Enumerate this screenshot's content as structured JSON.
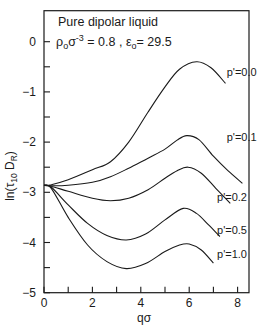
{
  "chart_data": {
    "type": "line",
    "title": "Pure dipolar liquid",
    "subtitle": "ρ₀σ³ = 0.8, ε₀ = 29.5",
    "xlabel": "qσ",
    "ylabel": "ln(τ₁₀D_R)",
    "xlim": [
      0,
      8.5
    ],
    "ylim": [
      -5,
      0.6
    ],
    "xticks": [
      0,
      2,
      4,
      6,
      8
    ],
    "xminor_ticks": [
      1,
      3,
      5,
      7
    ],
    "yticks": [
      0,
      -1,
      -2,
      -3,
      -4,
      -5
    ],
    "yminor_ticks": [
      -0.5,
      -1.5,
      -2.5,
      -3.5,
      -4.5
    ],
    "grid": false,
    "legend_position": "inline labels at curve ends (right)",
    "series": [
      {
        "name": "p'=0.0",
        "x": [
          0,
          0.3,
          1.0,
          2.0,
          2.75,
          3.5,
          4.3,
          5.0,
          5.6,
          6.3,
          6.9,
          7.5
        ],
        "y": [
          -2.86,
          -2.85,
          -2.75,
          -2.55,
          -2.39,
          -2.0,
          -1.4,
          -0.9,
          -0.55,
          -0.4,
          -0.52,
          -0.83
        ]
      },
      {
        "name": "p'=0.1",
        "x": [
          0,
          0.3,
          1.0,
          2.0,
          2.75,
          3.5,
          4.3,
          5.0,
          5.5,
          5.9,
          6.4,
          7.0,
          7.6,
          8.2
        ],
        "y": [
          -2.86,
          -2.87,
          -2.86,
          -2.8,
          -2.69,
          -2.52,
          -2.32,
          -2.14,
          -1.96,
          -1.87,
          -1.95,
          -2.28,
          -2.57,
          -2.82
        ]
      },
      {
        "name": "p'=0.2",
        "x": [
          0,
          0.3,
          1.0,
          2.0,
          2.75,
          3.5,
          4.3,
          5.0,
          5.5,
          5.95,
          6.5,
          7.1,
          7.7
        ],
        "y": [
          -2.86,
          -2.88,
          -2.98,
          -3.12,
          -3.17,
          -3.12,
          -2.95,
          -2.72,
          -2.57,
          -2.5,
          -2.62,
          -2.92,
          -3.22
        ]
      },
      {
        "name": "p'=0.5",
        "x": [
          0,
          0.3,
          1.0,
          1.8,
          2.6,
          3.4,
          4.2,
          5.0,
          5.75,
          6.3,
          6.8,
          7.27
        ],
        "y": [
          -2.86,
          -2.9,
          -3.25,
          -3.62,
          -3.86,
          -3.95,
          -3.83,
          -3.55,
          -3.32,
          -3.42,
          -3.65,
          -3.88
        ]
      },
      {
        "name": "p'=1.0",
        "x": [
          0,
          0.3,
          1.0,
          1.8,
          2.6,
          3.4,
          4.2,
          5.0,
          5.6,
          6.0,
          6.5,
          7.0
        ],
        "y": [
          -2.86,
          -2.92,
          -3.5,
          -4.05,
          -4.38,
          -4.52,
          -4.42,
          -4.18,
          -4.05,
          -4.03,
          -4.15,
          -4.41
        ]
      }
    ],
    "annotations": [
      {
        "text": "p'=0.0",
        "x": 7.55,
        "y": -0.6
      },
      {
        "text": "p'=0.1",
        "x": 7.55,
        "y": -1.9
      },
      {
        "text": "p'=0.2",
        "x": 7.15,
        "y": -3.1
      },
      {
        "text": "p'=0.5",
        "x": 7.15,
        "y": -3.75
      },
      {
        "text": "p'=1.0",
        "x": 7.15,
        "y": -4.23
      }
    ]
  },
  "labels": {
    "title": "Pure dipolar liquid",
    "subtitle_prefix": "ρ",
    "subtitle_rho_sub": "o",
    "subtitle_sigma": "σ",
    "subtitle_sigma_sup": "-3",
    "subtitle_rest": " = 0.8 ,  ε",
    "subtitle_eps_sub": "o",
    "subtitle_eps_val": "= 29.5",
    "xlabel": "qσ",
    "ylabel_main": "ln(τ",
    "ylabel_sub1": "10",
    "ylabel_mid": " D",
    "ylabel_sub2": "R",
    "ylabel_end": ")"
  }
}
